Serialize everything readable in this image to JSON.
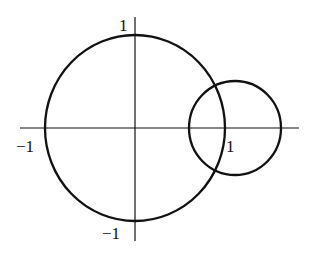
{
  "diagram": {
    "type": "two intersecting circles on coordinate axes",
    "axes": {
      "x_labels": [
        {
          "text": "−1",
          "value": -1
        },
        {
          "text": "1",
          "value": 1
        }
      ],
      "y_labels": [
        {
          "text": "1",
          "value": 1
        },
        {
          "text": "−1",
          "value": -1
        }
      ]
    },
    "circles": [
      {
        "name": "unit-circle",
        "center": [
          0,
          0
        ],
        "radius": 1
      },
      {
        "name": "small-circle",
        "center": [
          1.1,
          0
        ],
        "radius": 0.5
      }
    ],
    "stroke_color": "#111111",
    "background": "#ffffff"
  }
}
